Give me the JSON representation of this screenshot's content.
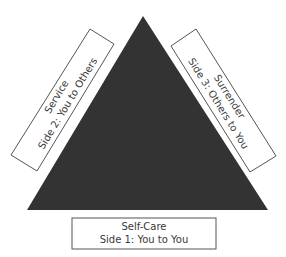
{
  "diagram": {
    "type": "triangle",
    "fill_color": "#333333",
    "sides": [
      {
        "id": "side1",
        "title": "Self-Care",
        "subtitle": "Side 1: You to You",
        "position": "bottom"
      },
      {
        "id": "side2",
        "title": "Service",
        "subtitle": "Side 2: You to Others",
        "position": "left"
      },
      {
        "id": "side3",
        "title": "Surrender",
        "subtitle": "Side 3: Others to You",
        "position": "right"
      }
    ]
  }
}
